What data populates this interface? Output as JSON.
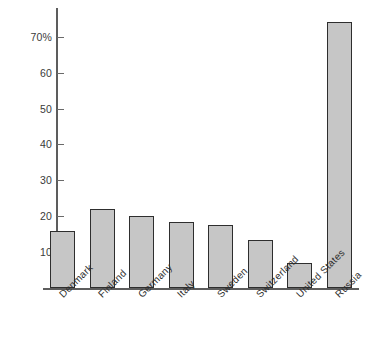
{
  "chart_data": {
    "type": "bar",
    "title": "",
    "subtitle": "",
    "xlabel": "",
    "ylabel": "",
    "categories": [
      "Denmark",
      "Finland",
      "Germany",
      "Italy",
      "Sweden",
      "Switzerland",
      "United States",
      "Russia"
    ],
    "values": [
      16,
      22,
      20,
      18.5,
      17.5,
      13.5,
      7,
      74
    ],
    "ylim": [
      0,
      78
    ],
    "yticks": [
      10,
      20,
      30,
      40,
      50,
      60,
      70
    ],
    "ytick_labels": [
      "10",
      "20",
      "30",
      "40",
      "50",
      "60",
      "70%"
    ],
    "grid": false,
    "legend": null,
    "bar_color": "#c6c6c6",
    "bar_edge_color": "#2e2e2e",
    "axis_color": "#5d5d5d",
    "background_color": "#ffffff"
  }
}
